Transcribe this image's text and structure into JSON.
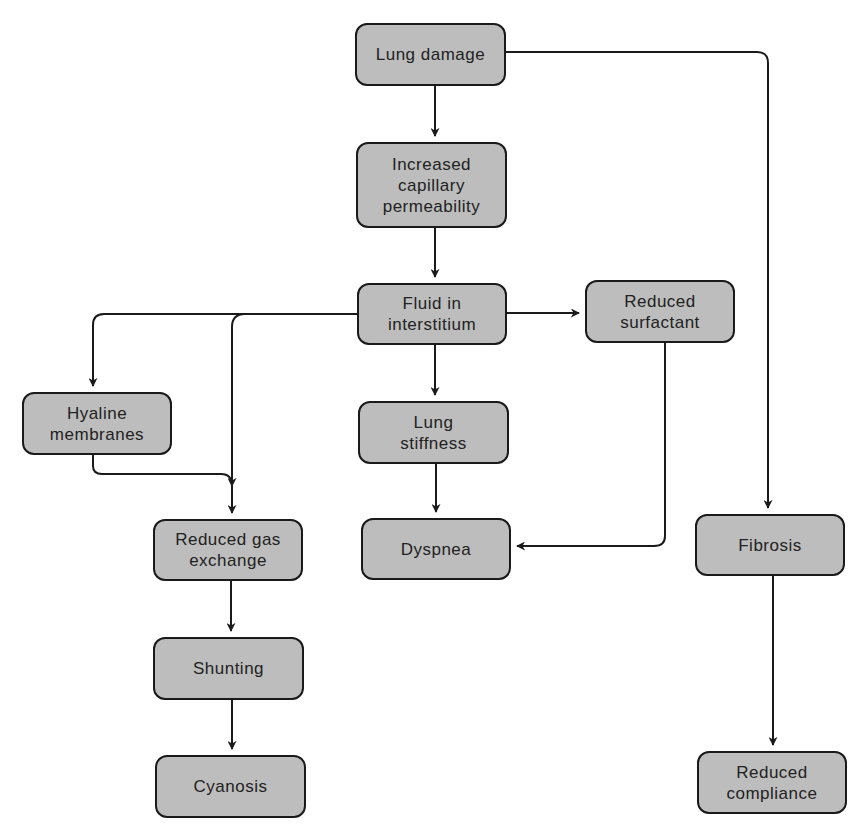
{
  "diagram": {
    "type": "flowchart",
    "nodes": [
      {
        "id": "lung_damage",
        "label": "Lung damage",
        "x": 355,
        "y": 23,
        "w": 151,
        "h": 63
      },
      {
        "id": "cap_perm",
        "label": "Increased\ncapillary\npermeability",
        "x": 356,
        "y": 142,
        "w": 151,
        "h": 86
      },
      {
        "id": "fluid",
        "label": "Fluid in\ninterstitium",
        "x": 357,
        "y": 283,
        "w": 150,
        "h": 62
      },
      {
        "id": "surfactant",
        "label": "Reduced\nsurfactant",
        "x": 585,
        "y": 280,
        "w": 150,
        "h": 63
      },
      {
        "id": "hyaline",
        "label": "Hyaline\nmembranes",
        "x": 22,
        "y": 392,
        "w": 150,
        "h": 63
      },
      {
        "id": "stiffness",
        "label": "Lung\nstiffness",
        "x": 358,
        "y": 401,
        "w": 151,
        "h": 63
      },
      {
        "id": "gas_exchange",
        "label": "Reduced gas\nexchange",
        "x": 153,
        "y": 519,
        "w": 150,
        "h": 62
      },
      {
        "id": "dyspnea",
        "label": "Dyspnea",
        "x": 361,
        "y": 518,
        "w": 150,
        "h": 62
      },
      {
        "id": "fibrosis",
        "label": "Fibrosis",
        "x": 695,
        "y": 514,
        "w": 150,
        "h": 62
      },
      {
        "id": "shunting",
        "label": "Shunting",
        "x": 153,
        "y": 637,
        "w": 151,
        "h": 63
      },
      {
        "id": "cyanosis",
        "label": "Cyanosis",
        "x": 155,
        "y": 755,
        "w": 151,
        "h": 63
      },
      {
        "id": "compliance",
        "label": "Reduced\ncompliance",
        "x": 697,
        "y": 751,
        "w": 150,
        "h": 63
      }
    ],
    "edges": [
      {
        "from": "lung_damage",
        "to": "cap_perm",
        "path": "M435,86 L435,136"
      },
      {
        "from": "lung_damage",
        "to": "fibrosis",
        "path": "M506,52 L757,52 Q768,52 768,63 L768,508"
      },
      {
        "from": "cap_perm",
        "to": "fluid",
        "path": "M435,228 L435,277"
      },
      {
        "from": "fluid",
        "to": "surfactant",
        "path": "M507,313 L579,313"
      },
      {
        "from": "fluid",
        "to": "hyaline",
        "path": "M357,314 L104,314 Q93,314 93,325 L93,386"
      },
      {
        "from": "fluid",
        "to": "gas_exchange",
        "path": "M245,314 Q232,314 232,327 L232,513"
      },
      {
        "from": "fluid",
        "to": "stiffness",
        "path": "M435,345 L435,395"
      },
      {
        "from": "hyaline",
        "to": "gas_exchange",
        "path": "M93,455 L93,466 Q93,474 102,474 L221,474 Q232,474 232,486"
      },
      {
        "from": "stiffness",
        "to": "dyspnea",
        "path": "M436,464 L436,512"
      },
      {
        "from": "surfactant",
        "to": "dyspnea",
        "path": "M665,343 L665,536 Q665,546 654,546 L517,546"
      },
      {
        "from": "gas_exchange",
        "to": "shunting",
        "path": "M231,581 L231,631"
      },
      {
        "from": "shunting",
        "to": "cyanosis",
        "path": "M232,700 L232,749"
      },
      {
        "from": "fibrosis",
        "to": "compliance",
        "path": "M773,576 L773,745"
      }
    ]
  },
  "colors": {
    "node_fill": "#bdbdbd",
    "stroke": "#1a1a1a",
    "text": "#222222",
    "background": "#ffffff"
  }
}
